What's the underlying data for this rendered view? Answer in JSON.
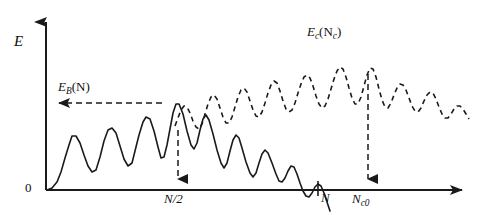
{
  "figure": {
    "kind": "energy-vs-cluster-size-schematic",
    "background_color": "#ffffff",
    "ink_color": "#1a1a1a"
  },
  "axes": {
    "y_label": "E",
    "origin_label": "0",
    "x_axis": {
      "start_x": 46,
      "end_x": 468,
      "y": 190,
      "has_arrow_head": true
    },
    "y_axis": {
      "x": 46,
      "start_y": 190,
      "end_y": 14,
      "has_arrow_head": true
    }
  },
  "annotations": {
    "binding_energy": {
      "label_main": "E",
      "label_sub": "B",
      "label_arg": "(N)",
      "arrow_direction": "left",
      "arrow_style": "dashed",
      "from_x": 162,
      "to_x": 50,
      "y": 103
    },
    "critical_energy": {
      "label_main": "E",
      "label_sub": "c",
      "label_arg_open": "(N",
      "label_arg_sub": "c",
      "label_arg_close": ")",
      "anchor_x": 335,
      "anchor_y": 35
    },
    "n_half_marker": {
      "label_main": "N/2",
      "arrow_direction": "down",
      "arrow_style": "dashed",
      "x": 178,
      "from_y": 130,
      "to_y": 188
    },
    "n_tick": {
      "label_main": "N",
      "x": 318,
      "tick_top_y": 181,
      "tick_bottom_y": 197
    },
    "nc0_marker": {
      "label_main": "N",
      "label_sub": "c0",
      "arrow_direction": "down",
      "arrow_style": "dashed",
      "x": 368,
      "from_y": 72,
      "to_y": 188
    }
  },
  "chart_data": {
    "type": "line",
    "title": "",
    "xlabel": "",
    "ylabel": "E",
    "grid": false,
    "legend": "none",
    "xlim": [
      46,
      470
    ],
    "ylim_pixels": [
      215,
      14
    ],
    "axis_zero_y": 190,
    "series": [
      {
        "name": "E_B(N)",
        "style": "solid",
        "stroke_width": 1.6,
        "description": "Solid oscillating curve: rises from origin with growing ripples to a maximum near N/2, then decays with damped oscillations crossing zero near N and plunging below the axis.",
        "points": [
          [
            47,
            190
          ],
          [
            52,
            188
          ],
          [
            57,
            182
          ],
          [
            61,
            172
          ],
          [
            65,
            158
          ],
          [
            69,
            145
          ],
          [
            72,
            136
          ],
          [
            76,
            136
          ],
          [
            80,
            143
          ],
          [
            84,
            155
          ],
          [
            88,
            166
          ],
          [
            92,
            172
          ],
          [
            96,
            170
          ],
          [
            100,
            157
          ],
          [
            104,
            141
          ],
          [
            108,
            130
          ],
          [
            112,
            128
          ],
          [
            116,
            133
          ],
          [
            120,
            146
          ],
          [
            124,
            159
          ],
          [
            128,
            166
          ],
          [
            132,
            163
          ],
          [
            135,
            151
          ],
          [
            139,
            135
          ],
          [
            143,
            122
          ],
          [
            146,
            117
          ],
          [
            150,
            119
          ],
          [
            154,
            131
          ],
          [
            158,
            147
          ],
          [
            161,
            158
          ],
          [
            164,
            157
          ],
          [
            167,
            145
          ],
          [
            170,
            129
          ],
          [
            173,
            113
          ],
          [
            176,
            104
          ],
          [
            179,
            104
          ],
          [
            183,
            114
          ],
          [
            187,
            131
          ],
          [
            191,
            145
          ],
          [
            194,
            149
          ],
          [
            197,
            143
          ],
          [
            200,
            130
          ],
          [
            203,
            119
          ],
          [
            206,
            115
          ],
          [
            209,
            120
          ],
          [
            213,
            134
          ],
          [
            217,
            150
          ],
          [
            221,
            163
          ],
          [
            224,
            168
          ],
          [
            227,
            163
          ],
          [
            230,
            151
          ],
          [
            233,
            140
          ],
          [
            236,
            135
          ],
          [
            239,
            138
          ],
          [
            242,
            148
          ],
          [
            246,
            162
          ],
          [
            250,
            173
          ],
          [
            253,
            177
          ],
          [
            256,
            173
          ],
          [
            259,
            163
          ],
          [
            262,
            154
          ],
          [
            265,
            150
          ],
          [
            268,
            153
          ],
          [
            272,
            163
          ],
          [
            276,
            174
          ],
          [
            279,
            181
          ],
          [
            282,
            182
          ],
          [
            285,
            178
          ],
          [
            288,
            171
          ],
          [
            291,
            166
          ],
          [
            294,
            167
          ],
          [
            297,
            174
          ],
          [
            300,
            183
          ],
          [
            303,
            191
          ],
          [
            306,
            196
          ],
          [
            309,
            197
          ],
          [
            312,
            193
          ],
          [
            315,
            187
          ],
          [
            318,
            184
          ],
          [
            321,
            186
          ],
          [
            324,
            193
          ],
          [
            327,
            202
          ],
          [
            330,
            211
          ]
        ]
      },
      {
        "name": "E_c(N_c)",
        "style": "dashed",
        "stroke_width": 1.6,
        "dash_pattern": "5,4",
        "description": "Dashed oscillating curve: begins mid-plot, rises with ripples to a global maximum at N_c0, then descends with damped ripples toward the right edge.",
        "points": [
          [
            175,
            126
          ],
          [
            178,
            118
          ],
          [
            181,
            110
          ],
          [
            184,
            106
          ],
          [
            187,
            107
          ],
          [
            190,
            113
          ],
          [
            193,
            121
          ],
          [
            196,
            127
          ],
          [
            199,
            129
          ],
          [
            202,
            124
          ],
          [
            205,
            114
          ],
          [
            208,
            104
          ],
          [
            211,
            97
          ],
          [
            214,
            95
          ],
          [
            217,
            99
          ],
          [
            220,
            108
          ],
          [
            223,
            117
          ],
          [
            226,
            123
          ],
          [
            229,
            123
          ],
          [
            232,
            117
          ],
          [
            235,
            107
          ],
          [
            238,
            97
          ],
          [
            241,
            90
          ],
          [
            244,
            88
          ],
          [
            247,
            92
          ],
          [
            250,
            101
          ],
          [
            253,
            110
          ],
          [
            256,
            116
          ],
          [
            259,
            117
          ],
          [
            262,
            112
          ],
          [
            265,
            103
          ],
          [
            268,
            93
          ],
          [
            271,
            85
          ],
          [
            274,
            81
          ],
          [
            277,
            83
          ],
          [
            280,
            91
          ],
          [
            283,
            101
          ],
          [
            286,
            109
          ],
          [
            289,
            112
          ],
          [
            292,
            110
          ],
          [
            295,
            103
          ],
          [
            298,
            93
          ],
          [
            301,
            84
          ],
          [
            304,
            77
          ],
          [
            307,
            75
          ],
          [
            310,
            78
          ],
          [
            313,
            86
          ],
          [
            316,
            96
          ],
          [
            319,
            104
          ],
          [
            322,
            108
          ],
          [
            325,
            106
          ],
          [
            328,
            99
          ],
          [
            331,
            89
          ],
          [
            334,
            79
          ],
          [
            337,
            71
          ],
          [
            340,
            67
          ],
          [
            343,
            69
          ],
          [
            346,
            77
          ],
          [
            349,
            88
          ],
          [
            352,
            98
          ],
          [
            355,
            104
          ],
          [
            358,
            104
          ],
          [
            361,
            97
          ],
          [
            364,
            86
          ],
          [
            367,
            75
          ],
          [
            370,
            68
          ],
          [
            373,
            69
          ],
          [
            376,
            77
          ],
          [
            379,
            89
          ],
          [
            382,
            100
          ],
          [
            385,
            107
          ],
          [
            388,
            108
          ],
          [
            391,
            103
          ],
          [
            394,
            95
          ],
          [
            397,
            88
          ],
          [
            400,
            84
          ],
          [
            403,
            85
          ],
          [
            406,
            90
          ],
          [
            409,
            98
          ],
          [
            412,
            106
          ],
          [
            415,
            111
          ],
          [
            418,
            112
          ],
          [
            421,
            108
          ],
          [
            424,
            101
          ],
          [
            427,
            95
          ],
          [
            430,
            92
          ],
          [
            433,
            93
          ],
          [
            436,
            99
          ],
          [
            439,
            107
          ],
          [
            442,
            114
          ],
          [
            445,
            118
          ],
          [
            448,
            118
          ],
          [
            451,
            114
          ],
          [
            454,
            109
          ],
          [
            457,
            106
          ],
          [
            460,
            106
          ],
          [
            463,
            109
          ],
          [
            466,
            114
          ],
          [
            469,
            119
          ]
        ]
      }
    ]
  }
}
